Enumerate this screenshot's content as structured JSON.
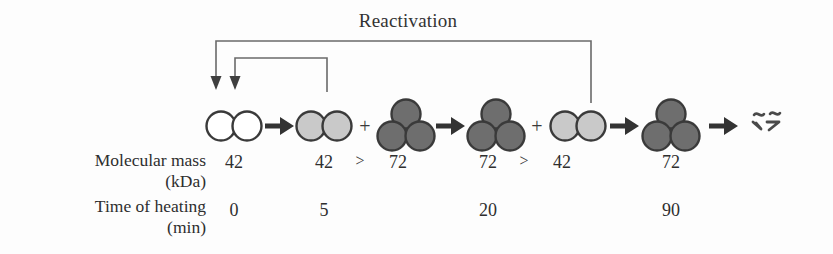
{
  "figure": {
    "title": "Reactivation",
    "background_color": "#fdfdfd",
    "text_color": "#2e2e2e"
  },
  "colors": {
    "empty_subunit_fill": "#ffffff",
    "light_subunit_fill": "#c9c9c9",
    "dark_subunit_fill": "#6e6e6e",
    "outline": "#3a3a3a",
    "arrow": "#333333",
    "bracket_line": "#6a6a6a"
  },
  "reaction_sequence": [
    {
      "id": "species-dimer-native",
      "kind": "dimer",
      "shade": "empty",
      "subunits": 2,
      "mass": "42",
      "time": "0"
    },
    {
      "id": "arrow-1",
      "kind": "arrow",
      "glyph": "→"
    },
    {
      "id": "species-dimer-light-1",
      "kind": "dimer",
      "shade": "light",
      "subunits": 2,
      "mass": "42",
      "time": "5"
    },
    {
      "id": "plus-1",
      "kind": "plus",
      "glyph": "+"
    },
    {
      "id": "species-trimer-dark-1",
      "kind": "trimer",
      "shade": "dark",
      "subunits": 3,
      "mass": "72",
      "time": ""
    },
    {
      "id": "arrow-2",
      "kind": "arrow",
      "glyph": "→"
    },
    {
      "id": "species-trimer-dark-2",
      "kind": "trimer",
      "shade": "dark",
      "subunits": 3,
      "mass": "72",
      "time": "20"
    },
    {
      "id": "plus-2",
      "kind": "plus",
      "glyph": "+"
    },
    {
      "id": "species-dimer-light-2",
      "kind": "dimer",
      "shade": "light",
      "subunits": 2,
      "mass": "42",
      "time": ""
    },
    {
      "id": "arrow-3",
      "kind": "arrow",
      "glyph": "→"
    },
    {
      "id": "species-trimer-dark-3",
      "kind": "trimer",
      "shade": "dark",
      "subunits": 3,
      "mass": "72",
      "time": "90"
    },
    {
      "id": "arrow-4",
      "kind": "arrow",
      "glyph": "→"
    },
    {
      "id": "species-denatured",
      "kind": "squiggle",
      "shade": "dark",
      "mass": "",
      "time": ""
    }
  ],
  "mass_row": {
    "label_line1": "Molecular mass",
    "label_line2": "(kDa)",
    "values": [
      "42",
      "42",
      "72",
      "72",
      "42",
      "72"
    ],
    "comparators": [
      ">",
      ">"
    ]
  },
  "time_row": {
    "label_line1": "Time of heating",
    "label_line2": "(min)",
    "values": [
      "0",
      "5",
      "20",
      "90"
    ]
  },
  "brackets": [
    {
      "id": "reactivation-bracket-outer",
      "from": "species-dimer-light-2",
      "to": "species-dimer-native",
      "arrowheads": 1
    },
    {
      "id": "reactivation-bracket-inner",
      "from": "species-dimer-light-1",
      "to": "species-dimer-native",
      "arrowheads": 1
    }
  ]
}
